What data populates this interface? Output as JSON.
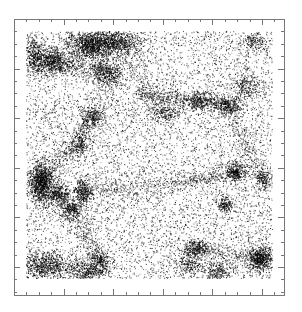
{
  "chart_data": {
    "type": "scatter",
    "title": "",
    "xlabel": "",
    "ylabel": "",
    "tick_labels": {
      "x": [],
      "y": []
    },
    "grid": false,
    "legend": null,
    "frame": {
      "left": 14,
      "top": 19,
      "right": 284,
      "bottom": 295,
      "color": "#777777"
    },
    "data_region": {
      "left": 26,
      "top": 31,
      "right": 272,
      "bottom": 278
    },
    "ticks": {
      "minor_spacing_px": 12.4,
      "major_every": 4,
      "minor_len": 3,
      "major_len": 6,
      "color": "#777777"
    },
    "point_color": "#000000",
    "background_points": 9000,
    "clusters": [
      {
        "x": 0.26,
        "y": 0.06,
        "sx": 0.05,
        "sy": 0.03,
        "n": 900
      },
      {
        "x": 0.36,
        "y": 0.04,
        "sx": 0.06,
        "sy": 0.025,
        "n": 700
      },
      {
        "x": 0.1,
        "y": 0.12,
        "sx": 0.04,
        "sy": 0.03,
        "n": 650
      },
      {
        "x": 0.03,
        "y": 0.1,
        "sx": 0.02,
        "sy": 0.04,
        "n": 300
      },
      {
        "x": 0.33,
        "y": 0.17,
        "sx": 0.03,
        "sy": 0.03,
        "n": 420
      },
      {
        "x": 0.27,
        "y": 0.35,
        "sx": 0.025,
        "sy": 0.025,
        "n": 300
      },
      {
        "x": 0.22,
        "y": 0.46,
        "sx": 0.02,
        "sy": 0.025,
        "n": 200
      },
      {
        "x": 0.06,
        "y": 0.61,
        "sx": 0.025,
        "sy": 0.04,
        "n": 1000
      },
      {
        "x": 0.13,
        "y": 0.66,
        "sx": 0.025,
        "sy": 0.02,
        "n": 350
      },
      {
        "x": 0.23,
        "y": 0.65,
        "sx": 0.018,
        "sy": 0.025,
        "n": 300
      },
      {
        "x": 0.18,
        "y": 0.72,
        "sx": 0.025,
        "sy": 0.02,
        "n": 260
      },
      {
        "x": 0.08,
        "y": 0.95,
        "sx": 0.05,
        "sy": 0.03,
        "n": 650
      },
      {
        "x": 0.25,
        "y": 0.97,
        "sx": 0.04,
        "sy": 0.02,
        "n": 380
      },
      {
        "x": 0.3,
        "y": 0.93,
        "sx": 0.02,
        "sy": 0.02,
        "n": 200
      },
      {
        "x": 0.85,
        "y": 0.57,
        "sx": 0.02,
        "sy": 0.02,
        "n": 320
      },
      {
        "x": 0.81,
        "y": 0.7,
        "sx": 0.015,
        "sy": 0.015,
        "n": 160
      },
      {
        "x": 0.96,
        "y": 0.6,
        "sx": 0.015,
        "sy": 0.02,
        "n": 150
      },
      {
        "x": 0.95,
        "y": 0.92,
        "sx": 0.025,
        "sy": 0.025,
        "n": 600
      },
      {
        "x": 0.69,
        "y": 0.88,
        "sx": 0.025,
        "sy": 0.018,
        "n": 260
      },
      {
        "x": 0.78,
        "y": 0.97,
        "sx": 0.03,
        "sy": 0.02,
        "n": 220
      },
      {
        "x": 0.82,
        "y": 0.3,
        "sx": 0.03,
        "sy": 0.018,
        "n": 280
      },
      {
        "x": 0.7,
        "y": 0.28,
        "sx": 0.03,
        "sy": 0.02,
        "n": 240
      },
      {
        "x": 0.9,
        "y": 0.22,
        "sx": 0.03,
        "sy": 0.03,
        "n": 220
      },
      {
        "x": 0.57,
        "y": 0.33,
        "sx": 0.04,
        "sy": 0.02,
        "n": 200
      },
      {
        "x": 0.66,
        "y": 0.94,
        "sx": 0.03,
        "sy": 0.02,
        "n": 180
      },
      {
        "x": 0.93,
        "y": 0.04,
        "sx": 0.03,
        "sy": 0.02,
        "n": 150
      }
    ],
    "filaments": [
      {
        "from": [
          0.45,
          0.25
        ],
        "to": [
          0.82,
          0.3
        ],
        "width": 0.015,
        "n": 500
      },
      {
        "from": [
          0.1,
          0.12
        ],
        "to": [
          0.33,
          0.17
        ],
        "width": 0.02,
        "n": 300
      },
      {
        "from": [
          0.06,
          0.61
        ],
        "to": [
          0.27,
          0.35
        ],
        "width": 0.02,
        "n": 350
      },
      {
        "from": [
          0.23,
          0.65
        ],
        "to": [
          0.6,
          0.62
        ],
        "width": 0.02,
        "n": 300
      },
      {
        "from": [
          0.18,
          0.72
        ],
        "to": [
          0.3,
          0.93
        ],
        "width": 0.02,
        "n": 260
      },
      {
        "from": [
          0.6,
          0.62
        ],
        "to": [
          0.85,
          0.57
        ],
        "width": 0.015,
        "n": 260
      },
      {
        "from": [
          0.69,
          0.88
        ],
        "to": [
          0.95,
          0.92
        ],
        "width": 0.015,
        "n": 220
      },
      {
        "from": [
          0.82,
          0.3
        ],
        "to": [
          0.96,
          0.6
        ],
        "width": 0.02,
        "n": 260
      },
      {
        "from": [
          0.36,
          0.04
        ],
        "to": [
          0.57,
          0.33
        ],
        "width": 0.02,
        "n": 220
      }
    ],
    "seed": 1337
  }
}
